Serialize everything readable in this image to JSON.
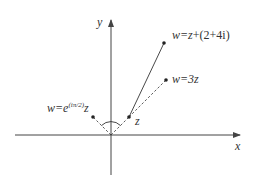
{
  "diagram": {
    "axes": {
      "x_label": "x",
      "y_label": "y"
    },
    "points": {
      "z": {
        "label": "z",
        "re": 1,
        "im": 1
      },
      "translate": {
        "label_prefix": "w=",
        "label_var": "z",
        "label_suffix": "+(2+4i)",
        "re": 3,
        "im": 5,
        "connector": "solid"
      },
      "scale": {
        "label_prefix": "w=3",
        "label_var": "z",
        "re": 3,
        "im": 3,
        "connector": "dashed"
      },
      "rotate": {
        "label_prefix": "w=e",
        "label_exp": "(iπ/2)",
        "label_var": "z",
        "re": -1,
        "im": 1,
        "connector": "dashed"
      }
    },
    "angle_marker": "arc between z and its rotation",
    "colors": {
      "ink": "#333333",
      "axis": "#444444",
      "background": "#ffffff"
    }
  }
}
